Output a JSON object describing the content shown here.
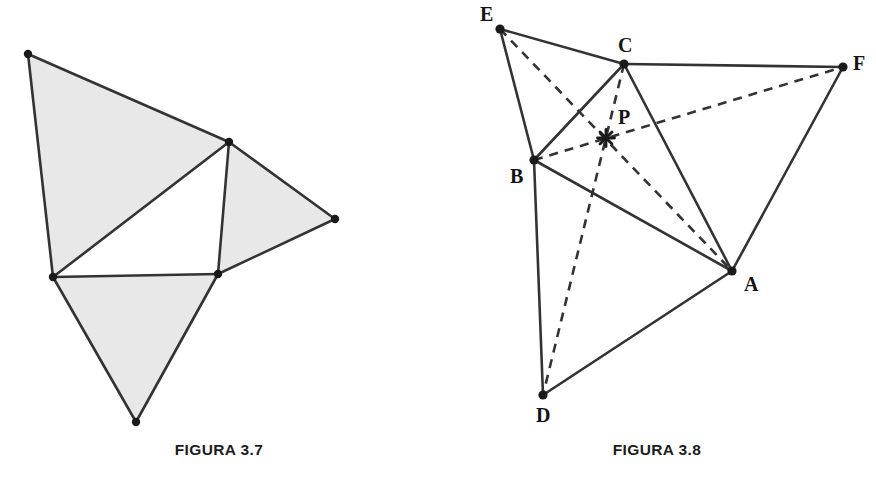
{
  "page": {
    "width": 876,
    "height": 494,
    "background": "#ffffff"
  },
  "style": {
    "stroke_color": "#333333",
    "fill_color": "#e8e8e8",
    "vertex_dot_color": "#1a1a1a",
    "label_color": "#141414",
    "caption_color": "#1c1c1c",
    "solid_stroke_width": 2.6,
    "dashed_stroke_width": 2.6,
    "dash_pattern": "9 7"
  },
  "figures": [
    {
      "id": "figura-3-7",
      "caption": "FIGURA 3.7",
      "panel": {
        "x": 0,
        "y": 0,
        "width": 438,
        "height": 494
      },
      "description": "Pinwheel of four triangles; three shaded light gray, central triangle unshaded",
      "vertices": [
        {
          "name": "top-left",
          "x": 28,
          "y": 54
        },
        {
          "name": "upper-middle",
          "x": 229,
          "y": 142
        },
        {
          "name": "right",
          "x": 335,
          "y": 219
        },
        {
          "name": "left-middle",
          "x": 53,
          "y": 277
        },
        {
          "name": "lower-middle",
          "x": 218,
          "y": 274
        },
        {
          "name": "bottom-apex",
          "x": 136,
          "y": 422
        }
      ],
      "regions": [
        {
          "name": "upper-left-shaded-triangle",
          "shaded": true,
          "points": "28,54 229,142 53,277"
        },
        {
          "name": "right-shaded-triangle",
          "shaded": true,
          "points": "229,142 335,219 218,274"
        },
        {
          "name": "bottom-shaded-triangle",
          "shaded": true,
          "points": "53,277 218,274 136,422"
        },
        {
          "name": "central-unshaded-triangle",
          "shaded": false,
          "points": "229,142 218,274 53,277"
        }
      ],
      "edges": [
        {
          "name": "edge-topleft-uppermiddle",
          "x1": 28,
          "y1": 54,
          "x2": 229,
          "y2": 142
        },
        {
          "name": "edge-topleft-leftmiddle",
          "x1": 28,
          "y1": 54,
          "x2": 53,
          "y2": 277
        },
        {
          "name": "edge-uppermiddle-leftmiddle",
          "x1": 229,
          "y1": 142,
          "x2": 53,
          "y2": 277
        },
        {
          "name": "edge-uppermiddle-right",
          "x1": 229,
          "y1": 142,
          "x2": 335,
          "y2": 219
        },
        {
          "name": "edge-uppermiddle-lowermiddle",
          "x1": 229,
          "y1": 142,
          "x2": 218,
          "y2": 274
        },
        {
          "name": "edge-right-lowermiddle",
          "x1": 335,
          "y1": 219,
          "x2": 218,
          "y2": 274
        },
        {
          "name": "edge-leftmiddle-lowermiddle",
          "x1": 53,
          "y1": 277,
          "x2": 218,
          "y2": 274
        },
        {
          "name": "edge-leftmiddle-bottomapex",
          "x1": 53,
          "y1": 277,
          "x2": 136,
          "y2": 422
        },
        {
          "name": "edge-lowermiddle-bottomapex",
          "x1": 218,
          "y1": 274,
          "x2": 136,
          "y2": 422
        }
      ]
    },
    {
      "id": "figura-3-8",
      "caption": "FIGURA 3.8",
      "panel": {
        "x": 438,
        "y": 0,
        "width": 438,
        "height": 494
      },
      "description": "Hexagonal configuration ABCDEF with three dashed cevians EA, CD and BF concurrent at point P",
      "points": [
        {
          "label": "A",
          "x": 294,
          "y": 271,
          "label_x": 306,
          "label_y": 274
        },
        {
          "label": "B",
          "x": 96,
          "y": 160,
          "label_x": 72,
          "label_y": 166
        },
        {
          "label": "C",
          "x": 186,
          "y": 64,
          "label_x": 180,
          "label_y": 35
        },
        {
          "label": "D",
          "x": 105,
          "y": 395,
          "label_x": 98,
          "label_y": 405
        },
        {
          "label": "E",
          "x": 62,
          "y": 29,
          "label_x": 42,
          "label_y": 4
        },
        {
          "label": "F",
          "x": 405,
          "y": 67,
          "label_x": 415,
          "label_y": 53
        },
        {
          "label": "P",
          "x": 168,
          "y": 138,
          "label_x": 180,
          "label_y": 107
        }
      ],
      "solid_edges": [
        {
          "name": "edge-E-C",
          "from": "E",
          "to": "C",
          "x1": 62,
          "y1": 29,
          "x2": 186,
          "y2": 64
        },
        {
          "name": "edge-E-B",
          "from": "E",
          "to": "B",
          "x1": 62,
          "y1": 29,
          "x2": 96,
          "y2": 160
        },
        {
          "name": "edge-C-F",
          "from": "C",
          "to": "F",
          "x1": 186,
          "y1": 64,
          "x2": 405,
          "y2": 67
        },
        {
          "name": "edge-C-B",
          "from": "C",
          "to": "B",
          "x1": 186,
          "y1": 64,
          "x2": 96,
          "y2": 160
        },
        {
          "name": "edge-C-A",
          "from": "C",
          "to": "A",
          "x1": 186,
          "y1": 64,
          "x2": 294,
          "y2": 271
        },
        {
          "name": "edge-F-A",
          "from": "F",
          "to": "A",
          "x1": 405,
          "y1": 67,
          "x2": 294,
          "y2": 271
        },
        {
          "name": "edge-B-A",
          "from": "B",
          "to": "A",
          "x1": 96,
          "y1": 160,
          "x2": 294,
          "y2": 271
        },
        {
          "name": "edge-B-D",
          "from": "B",
          "to": "D",
          "x1": 96,
          "y1": 160,
          "x2": 105,
          "y2": 395
        },
        {
          "name": "edge-D-A",
          "from": "D",
          "to": "A",
          "x1": 105,
          "y1": 395,
          "x2": 294,
          "y2": 271
        }
      ],
      "dashed_cevians": [
        {
          "name": "cevian-E-A",
          "from": "E",
          "to": "A",
          "x1": 62,
          "y1": 29,
          "x2": 294,
          "y2": 271
        },
        {
          "name": "cevian-C-D",
          "from": "C",
          "to": "D",
          "x1": 186,
          "y1": 64,
          "x2": 105,
          "y2": 395
        },
        {
          "name": "cevian-B-F",
          "from": "B",
          "to": "F",
          "x1": 96,
          "y1": 160,
          "x2": 405,
          "y2": 67
        }
      ],
      "concurrency_point": {
        "label": "P",
        "x": 168,
        "y": 138,
        "marker": "star"
      }
    }
  ]
}
